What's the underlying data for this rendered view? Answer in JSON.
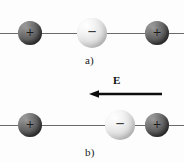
{
  "figure": {
    "background_color": "#fdfdfd"
  },
  "colors": {
    "positive_charge": "#5e5e5e",
    "negative_charge": "#e2e2e2",
    "axis_line": "#6b6b6b",
    "arrow": "#0d0d0d",
    "text": "#1a1a1a"
  },
  "panels": [
    {
      "id": "a",
      "caption": "a)",
      "description": "Unpolarized molecule, no external field",
      "axis_y": 33,
      "charges": [
        {
          "sign": "+",
          "polarity": "positive",
          "x": 30,
          "y": 33,
          "radius": 12
        },
        {
          "sign": "−",
          "polarity": "negative",
          "x": 92,
          "y": 33,
          "radius": 15
        },
        {
          "sign": "+",
          "polarity": "positive",
          "x": 157,
          "y": 33,
          "radius": 12
        }
      ]
    },
    {
      "id": "b",
      "caption": "b)",
      "description": "Polarized molecule, negative charge displaced toward field source",
      "axis_y": 125,
      "charges": [
        {
          "sign": "+",
          "polarity": "positive",
          "x": 30,
          "y": 125,
          "radius": 12
        },
        {
          "sign": "−",
          "polarity": "negative",
          "x": 120,
          "y": 125,
          "radius": 15
        },
        {
          "sign": "+",
          "polarity": "positive",
          "x": 157,
          "y": 125,
          "radius": 12
        }
      ]
    }
  ],
  "field": {
    "label": "E",
    "direction": "left",
    "arrow_start_x": 162,
    "arrow_end_x": 90,
    "arrow_y": 94
  }
}
